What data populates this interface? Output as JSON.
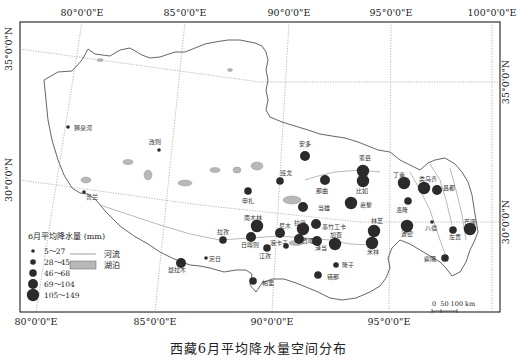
{
  "map": {
    "caption": "西藏6月平均降水量空间分布",
    "frame": {
      "x": 20,
      "y": 22,
      "w": 480,
      "h": 290
    },
    "axis_labels": {
      "top": [
        {
          "label": "80°0'0\"E",
          "x": 82
        },
        {
          "label": "85°0'0\"E",
          "x": 185
        },
        {
          "label": "90°0'0\"E",
          "x": 289
        },
        {
          "label": "95°0'0\"E",
          "x": 391
        },
        {
          "label": "100°0'0\"E",
          "x": 492
        }
      ],
      "bottom": [
        {
          "label": "80°0'0\"E",
          "x": 36
        },
        {
          "label": "85°0'0\"E",
          "x": 155
        },
        {
          "label": "90°0'0\"E",
          "x": 272
        },
        {
          "label": "95°0'0\"E",
          "x": 389
        }
      ],
      "left": [
        {
          "label": "35°0'0\"N",
          "y": 49
        },
        {
          "label": "30°0'0\"N",
          "y": 180
        }
      ],
      "right": [
        {
          "label": "35°0'0\"N",
          "y": 82
        },
        {
          "label": "30°0'0\"N",
          "y": 222
        }
      ]
    },
    "legend": {
      "title": "6月平均降水量 (mm)",
      "classes": [
        {
          "label": "5～27",
          "r": 1.8
        },
        {
          "label": "28～45",
          "r": 2.8
        },
        {
          "label": "46～68",
          "r": 3.8
        },
        {
          "label": "69～104",
          "r": 5
        },
        {
          "label": "105～149",
          "r": 6.2
        }
      ],
      "river_label": "河流",
      "lake_label": "湖泊"
    },
    "scale_bar": {
      "label": "0  50 100 km"
    },
    "colors": {
      "station": "#2b2b2b",
      "boundary": "#555555",
      "grid": "#9a9a9a",
      "lake": "#b8b8b8",
      "frame": "#333333"
    },
    "stations": [
      {
        "name": "狮泉河",
        "x": 68,
        "y": 127,
        "cls": 0,
        "lx": 74,
        "ly": 130,
        "anchor": "start"
      },
      {
        "name": "改则",
        "x": 159,
        "y": 150,
        "cls": 0,
        "lx": 155,
        "ly": 144,
        "anchor": "middle"
      },
      {
        "name": "普兰",
        "x": 84,
        "y": 192,
        "cls": 0,
        "lx": 92,
        "ly": 199,
        "anchor": "middle"
      },
      {
        "name": "安多",
        "x": 305,
        "y": 156,
        "cls": 3,
        "lx": 305,
        "ly": 146,
        "anchor": "middle"
      },
      {
        "name": "申扎",
        "x": 248,
        "y": 191,
        "cls": 2,
        "lx": 248,
        "ly": 203,
        "anchor": "middle"
      },
      {
        "name": "班戈",
        "x": 280,
        "y": 181,
        "cls": 2,
        "lx": 286,
        "ly": 175,
        "anchor": "middle"
      },
      {
        "name": "那曲",
        "x": 325,
        "y": 180,
        "cls": 3,
        "lx": 322,
        "ly": 193,
        "anchor": "middle"
      },
      {
        "name": "索县",
        "x": 363,
        "y": 171,
        "cls": 4,
        "lx": 365,
        "ly": 160,
        "anchor": "middle"
      },
      {
        "name": "比如",
        "x": 363,
        "y": 181,
        "cls": 4,
        "lx": 362,
        "ly": 193,
        "anchor": "middle"
      },
      {
        "name": "当雄",
        "x": 303,
        "y": 207,
        "cls": 3,
        "lx": 318,
        "ly": 210,
        "anchor": "start"
      },
      {
        "name": "嘉黎",
        "x": 351,
        "y": 203,
        "cls": 4,
        "lx": 360,
        "ly": 207,
        "anchor": "start"
      },
      {
        "name": "丁青",
        "x": 404,
        "y": 183,
        "cls": 4,
        "lx": 399,
        "ly": 177,
        "anchor": "middle"
      },
      {
        "name": "类乌齐",
        "x": 424,
        "y": 188,
        "cls": 4,
        "lx": 428,
        "ly": 181,
        "anchor": "middle"
      },
      {
        "name": "昌都",
        "x": 437,
        "y": 190,
        "cls": 3,
        "lx": 443,
        "ly": 190,
        "anchor": "start"
      },
      {
        "name": "洛隆",
        "x": 408,
        "y": 201,
        "cls": 2,
        "lx": 402,
        "ly": 212,
        "anchor": "middle"
      },
      {
        "name": "南木林",
        "x": 257,
        "y": 226,
        "cls": 4,
        "lx": 253,
        "ly": 220,
        "anchor": "middle"
      },
      {
        "name": "拉孜",
        "x": 223,
        "y": 240,
        "cls": 2,
        "lx": 223,
        "ly": 234,
        "anchor": "middle"
      },
      {
        "name": "日喀则",
        "x": 251,
        "y": 237,
        "cls": 3,
        "lx": 250,
        "ly": 247,
        "anchor": "middle"
      },
      {
        "name": "尼木",
        "x": 280,
        "y": 233,
        "cls": 3,
        "lx": 285,
        "ly": 228,
        "anchor": "middle"
      },
      {
        "name": "浪卡子",
        "x": 286,
        "y": 246,
        "cls": 1,
        "lx": 279,
        "ly": 245,
        "anchor": "middle"
      },
      {
        "name": "江孜",
        "x": 267,
        "y": 248,
        "cls": 2,
        "lx": 265,
        "ly": 258,
        "anchor": "middle"
      },
      {
        "name": "拉萨",
        "x": 303,
        "y": 229,
        "cls": 4,
        "lx": 300,
        "ly": 225,
        "anchor": "middle"
      },
      {
        "name": "墨竹工卡",
        "x": 316,
        "y": 224,
        "cls": 3,
        "lx": 322,
        "ly": 229,
        "anchor": "start"
      },
      {
        "name": "贡嘎",
        "x": 299,
        "y": 239,
        "cls": 3,
        "lx": 308,
        "ly": 243,
        "anchor": "middle"
      },
      {
        "name": "泽当",
        "x": 317,
        "y": 241,
        "cls": 3,
        "lx": 321,
        "ly": 250,
        "anchor": "middle"
      },
      {
        "name": "加查",
        "x": 335,
        "y": 244,
        "cls": 4,
        "lx": 336,
        "ly": 237,
        "anchor": "middle"
      },
      {
        "name": "林芝",
        "x": 374,
        "y": 231,
        "cls": 4,
        "lx": 377,
        "ly": 223,
        "anchor": "middle"
      },
      {
        "name": "米林",
        "x": 372,
        "y": 243,
        "cls": 4,
        "lx": 373,
        "ly": 254,
        "anchor": "middle"
      },
      {
        "name": "波密",
        "x": 407,
        "y": 226,
        "cls": 4,
        "lx": 407,
        "ly": 236,
        "anchor": "middle"
      },
      {
        "name": "八宿",
        "x": 432,
        "y": 222,
        "cls": 0,
        "lx": 431,
        "ly": 230,
        "anchor": "middle"
      },
      {
        "name": "左贡",
        "x": 453,
        "y": 230,
        "cls": 2,
        "lx": 455,
        "ly": 239,
        "anchor": "middle"
      },
      {
        "name": "芒康",
        "x": 470,
        "y": 229,
        "cls": 4,
        "lx": 470,
        "ly": 224,
        "anchor": "middle"
      },
      {
        "name": "察隅",
        "x": 445,
        "y": 258,
        "cls": 2,
        "lx": 436,
        "ly": 261,
        "anchor": "end"
      },
      {
        "name": "隆子",
        "x": 336,
        "y": 265,
        "cls": 1,
        "lx": 342,
        "ly": 267,
        "anchor": "start"
      },
      {
        "name": "错那",
        "x": 318,
        "y": 275,
        "cls": 2,
        "lx": 327,
        "ly": 279,
        "anchor": "start"
      },
      {
        "name": "定日",
        "x": 206,
        "y": 258,
        "cls": 0,
        "lx": 209,
        "ly": 261,
        "anchor": "start"
      },
      {
        "name": "聂拉木",
        "x": 181,
        "y": 263,
        "cls": 3,
        "lx": 177,
        "ly": 272,
        "anchor": "middle"
      },
      {
        "name": "帕里",
        "x": 253,
        "y": 281,
        "cls": 2,
        "lx": 262,
        "ly": 285,
        "anchor": "start"
      }
    ]
  }
}
